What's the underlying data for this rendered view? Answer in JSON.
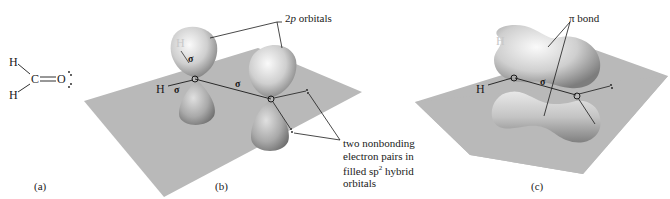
{
  "panels": {
    "a": {
      "label": "(a)",
      "lewis": {
        "h_top": "H",
        "h_bottom": "H",
        "c": "C",
        "o": "O",
        "lone_pairs": ":"
      }
    },
    "b": {
      "label": "(b)",
      "atoms": {
        "h_ghost": "H",
        "h_left": "H"
      },
      "sigma_symbol": "σ",
      "orbitals_label_prefix": "2",
      "orbitals_label_italic": "p",
      "orbitals_label_suffix": " orbitals",
      "nonbonding_note_line1": "two nonbonding",
      "nonbonding_note_line2": "electron pairs in",
      "nonbonding_note_line3_prefix": "filled sp",
      "nonbonding_note_sup": "2",
      "nonbonding_note_line3_suffix": " hybrid",
      "nonbonding_note_line4": "orbitals"
    },
    "c": {
      "label": "(c)",
      "atoms": {
        "h_ghost": "H",
        "h_left": "H"
      },
      "sigma_symbol": "σ",
      "pi_label": "π bond"
    }
  },
  "colors": {
    "plane": "#b9b9b9",
    "lobe_light": "#f2f2f2",
    "lobe_dark": "#8a8a8a",
    "ink": "#1a1a1a"
  }
}
